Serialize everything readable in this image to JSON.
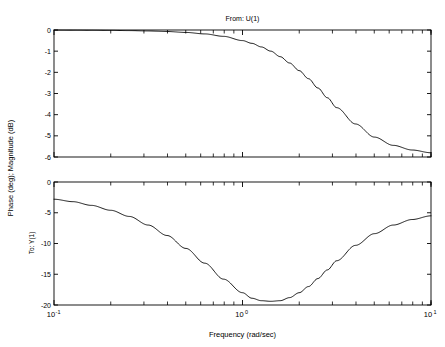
{
  "figure": {
    "title": "From: U(1)",
    "xlabel": "Frequency (rad/sec)",
    "ylabel": "Phase (deg); Magnitude (dB)",
    "row_label": "To: Y(1)",
    "line_color": "#000000",
    "axis_color": "#000000",
    "background": "#ffffff"
  },
  "xticks": [
    {
      "value": 0.1,
      "label_mantissa": "10",
      "label_exp": "-1"
    },
    {
      "value": 1,
      "label_mantissa": "10",
      "label_exp": "0"
    },
    {
      "value": 10,
      "label_mantissa": "10",
      "label_exp": "1"
    }
  ],
  "mag_yticks": [
    "0",
    "-1",
    "-2",
    "-3",
    "-4",
    "-5",
    "-6"
  ],
  "phase_yticks": [
    "0",
    "-5",
    "-10",
    "-15",
    "-20"
  ],
  "chart_data": [
    {
      "type": "line",
      "title": "From: U(1)",
      "xlabel": "",
      "ylabel": "Magnitude (dB)",
      "xscale": "log",
      "xlim": [
        0.1,
        10
      ],
      "ylim": [
        -6,
        0
      ],
      "grid": false,
      "legend": null,
      "series": [
        {
          "name": "magnitude",
          "x": [
            0.1,
            0.126,
            0.158,
            0.2,
            0.251,
            0.316,
            0.398,
            0.501,
            0.631,
            0.794,
            1.0,
            1.122,
            1.259,
            1.413,
            1.585,
            1.778,
            2.0,
            2.239,
            2.512,
            2.818,
            3.162,
            3.981,
            5.012,
            6.31,
            7.943,
            10.0
          ],
          "values": [
            -0.004,
            -0.007,
            -0.011,
            -0.018,
            -0.028,
            -0.045,
            -0.072,
            -0.115,
            -0.185,
            -0.3,
            -0.5,
            -0.63,
            -0.8,
            -1.0,
            -1.26,
            -1.56,
            -1.92,
            -2.3,
            -2.74,
            -3.2,
            -3.67,
            -4.44,
            -5.06,
            -5.45,
            -5.67,
            -5.8
          ]
        }
      ]
    },
    {
      "type": "line",
      "title": "",
      "xlabel": "Frequency (rad/sec)",
      "ylabel": "Phase (deg)",
      "xscale": "log",
      "xlim": [
        0.1,
        10
      ],
      "ylim": [
        -20,
        0
      ],
      "grid": false,
      "legend": null,
      "series": [
        {
          "name": "phase",
          "x": [
            0.1,
            0.126,
            0.158,
            0.2,
            0.251,
            0.316,
            0.398,
            0.501,
            0.631,
            0.794,
            1.0,
            1.122,
            1.259,
            1.413,
            1.585,
            1.778,
            2.0,
            2.239,
            2.512,
            2.818,
            3.162,
            3.981,
            5.012,
            6.31,
            7.943,
            10.0
          ],
          "values": [
            -2.8,
            -3.2,
            -3.8,
            -4.6,
            -5.6,
            -7.0,
            -8.7,
            -10.8,
            -13.2,
            -15.8,
            -18.0,
            -18.9,
            -19.3,
            -19.4,
            -19.3,
            -18.8,
            -18.0,
            -17.0,
            -15.7,
            -14.3,
            -12.8,
            -10.3,
            -8.4,
            -7.0,
            -6.1,
            -5.5
          ]
        }
      ]
    }
  ]
}
